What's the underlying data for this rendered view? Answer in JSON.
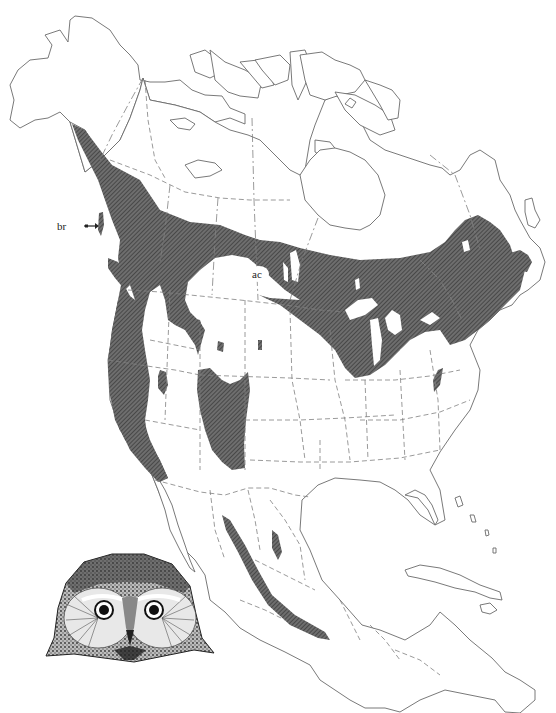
{
  "map": {
    "subject": "Species range map of North America",
    "labels": {
      "br": "br",
      "ac": "ac"
    },
    "legend_colors": {
      "range_fill": "#5a5a5a",
      "outline": "#6a6a6a",
      "background": "#ffffff"
    },
    "illustration": "owl-head"
  }
}
